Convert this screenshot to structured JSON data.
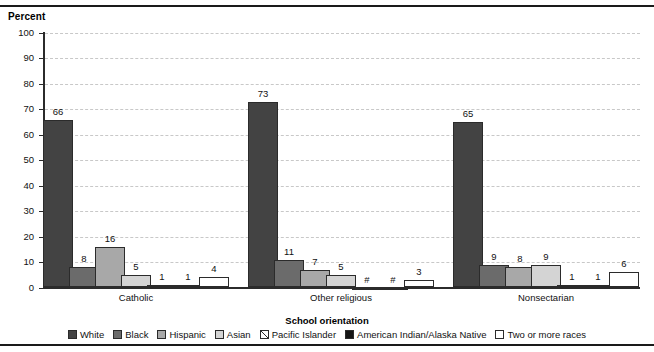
{
  "chart_data": {
    "type": "bar",
    "title": "",
    "ylabel": "Percent",
    "xlabel": "School orientation",
    "ylim": [
      0,
      100
    ],
    "yticks": [
      100,
      90,
      80,
      70,
      60,
      50,
      40,
      30,
      20,
      10,
      0
    ],
    "grid": true,
    "legend_position": "bottom",
    "categories": [
      "Catholic",
      "Other religious",
      "Nonsectarian"
    ],
    "series": [
      {
        "name": "White",
        "color": "#434343",
        "pattern": "solid",
        "values": [
          66,
          73,
          65
        ],
        "labels": [
          "66",
          "73",
          "65"
        ]
      },
      {
        "name": "Black",
        "color": "#6b6b6b",
        "pattern": "solid",
        "values": [
          8,
          11,
          9
        ],
        "labels": [
          "8",
          "11",
          "9"
        ]
      },
      {
        "name": "Hispanic",
        "color": "#a8a8a8",
        "pattern": "solid",
        "values": [
          16,
          7,
          8
        ],
        "labels": [
          "16",
          "7",
          "8"
        ]
      },
      {
        "name": "Asian",
        "color": "#d4d4d4",
        "pattern": "solid",
        "values": [
          5,
          5,
          9
        ],
        "labels": [
          "5",
          "5",
          "9"
        ]
      },
      {
        "name": "Pacific Islander",
        "color": "#ffffff",
        "pattern": "hatch",
        "values": [
          1,
          0,
          1
        ],
        "labels": [
          "1",
          "#",
          "1"
        ]
      },
      {
        "name": "American Indian/Alaska Native",
        "color": "#151515",
        "pattern": "solid",
        "values": [
          1,
          0,
          1
        ],
        "labels": [
          "1",
          "#",
          "1"
        ]
      },
      {
        "name": "Two or more races",
        "color": "#ffffff",
        "pattern": "solid",
        "values": [
          4,
          3,
          6
        ],
        "labels": [
          "4",
          "3",
          "6"
        ]
      }
    ]
  }
}
